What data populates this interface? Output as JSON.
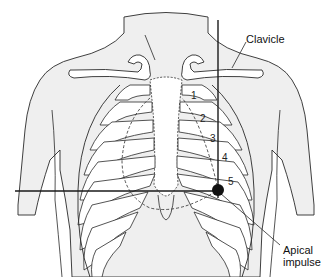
{
  "figure": {
    "colors": {
      "skin_fill": "#efefef",
      "outline": "#2a2a2a",
      "reference_line": "#1a1a1a",
      "marker": "#111111",
      "background": "#ffffff"
    },
    "labels": {
      "clavicle": "Clavicle",
      "apical_line1": "Apical",
      "apical_line2": "impulse"
    },
    "rib_numbers": [
      "1",
      "2",
      "3",
      "4",
      "5"
    ],
    "marker": {
      "name": "apical-impulse-point",
      "x": 218,
      "y": 190
    },
    "reference_lines": {
      "vertical": {
        "x": 218,
        "y1": 20,
        "y2": 198,
        "description": "midclavicular line"
      },
      "horizontal": {
        "y": 191,
        "x1": 15,
        "x2": 218,
        "description": "fifth intercostal space level"
      }
    }
  }
}
